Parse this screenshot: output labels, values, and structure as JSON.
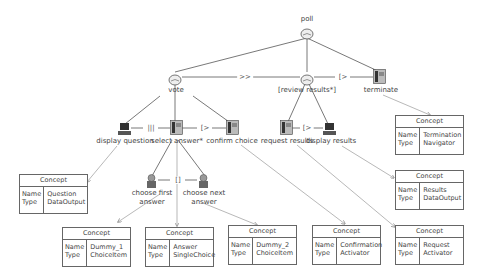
{
  "diagram": {
    "type": "ctt-task-model",
    "nodes": {
      "poll": {
        "label": "poll",
        "kind": "abstract"
      },
      "vote": {
        "label": "vote",
        "kind": "abstract"
      },
      "review_results": {
        "label": "[review results*]",
        "kind": "abstract"
      },
      "terminate": {
        "label": "terminate",
        "kind": "interaction"
      },
      "display_question": {
        "label": "display question",
        "kind": "application"
      },
      "select_answer": {
        "label": "select answer*",
        "kind": "interaction"
      },
      "confirm_choice": {
        "label": "confirm choice",
        "kind": "interaction"
      },
      "request_results": {
        "label": "request results",
        "kind": "interaction"
      },
      "display_results": {
        "label": "display results",
        "kind": "application"
      },
      "choose_first_answer": {
        "label_line1": "choose first",
        "label_line2": "answer",
        "kind": "user"
      },
      "choose_next_answer": {
        "label_line1": "choose next",
        "label_line2": "answer",
        "kind": "user"
      }
    },
    "operators": {
      "vote_review": ">>",
      "review_terminate": "[>",
      "display_select": "|||",
      "select_confirm": "[>",
      "request_display": "[>",
      "first_next": "[]"
    },
    "concepts": {
      "header": "Concept",
      "name_key": "Name",
      "type_key": "Type",
      "termination": {
        "name": "Termination",
        "type": "Navigator"
      },
      "question": {
        "name": "Question",
        "type": "DataOutput"
      },
      "results": {
        "name": "Results",
        "type": "DataOutput"
      },
      "dummy1": {
        "name": "Dummy_1",
        "type": "ChoiceItem"
      },
      "answer": {
        "name": "Answer",
        "type": "SingleChoice"
      },
      "dummy2": {
        "name": "Dummy_2",
        "type": "ChoiceItem"
      },
      "confirmation": {
        "name": "Confirmation",
        "type": "Activator"
      },
      "request": {
        "name": "Request",
        "type": "Activator"
      }
    }
  }
}
